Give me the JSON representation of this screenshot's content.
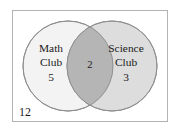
{
  "figure": {
    "type": "venn-diagram",
    "universe": {
      "label": "12",
      "border_color": "#b0b0b0",
      "fill_color": "#ffffff"
    },
    "sets": [
      {
        "id": "math-club",
        "name_line1": "Math",
        "name_line2": "Club",
        "count": "5",
        "fill_color": "#f2f2f2",
        "stroke_color": "#8a8a8a"
      },
      {
        "id": "science-club",
        "name_line1": "Science",
        "name_line2": "Club",
        "count": "3",
        "fill_color": "#dcdcdc",
        "stroke_color": "#8a8a8a"
      }
    ],
    "intersection": {
      "label": "2",
      "fill_color": "#b4b4b4"
    }
  }
}
